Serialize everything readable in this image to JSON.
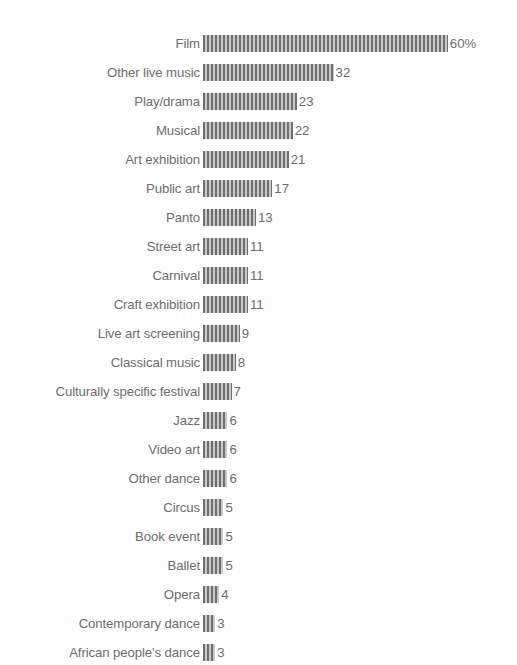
{
  "chart_data": {
    "type": "bar",
    "orientation": "horizontal",
    "title": "",
    "subtitle": "",
    "xlabel": "",
    "ylabel": "",
    "unit": "%",
    "grid": false,
    "legend": null,
    "xlim": [
      0,
      60
    ],
    "categories": [
      "Film",
      "Other live music",
      "Play/drama",
      "Musical",
      "Art exhibition",
      "Public art",
      "Panto",
      "Street art",
      "Carnival",
      "Craft exhibition",
      "Live art screening",
      "Classical music",
      "Culturally specific festival",
      "Jazz",
      "Video art",
      "Other dance",
      "Circus",
      "Book event",
      "Ballet",
      "Opera",
      "Contemporary dance",
      "African people's dance"
    ],
    "values": [
      60,
      32,
      23,
      22,
      21,
      17,
      13,
      11,
      11,
      11,
      9,
      8,
      7,
      6,
      6,
      6,
      5,
      5,
      5,
      4,
      3,
      3
    ],
    "value_labels": [
      "60%",
      "32",
      "23",
      "22",
      "21",
      "17",
      "13",
      "11",
      "11",
      "11",
      "9",
      "8",
      "7",
      "6",
      "6",
      "6",
      "5",
      "5",
      "5",
      "4",
      "3",
      "3"
    ],
    "bar_color": "#7d7d7d",
    "text_color": "#6d6d6d",
    "background_color": "#fdfdfd",
    "pixels_per_unit": 4.08
  }
}
